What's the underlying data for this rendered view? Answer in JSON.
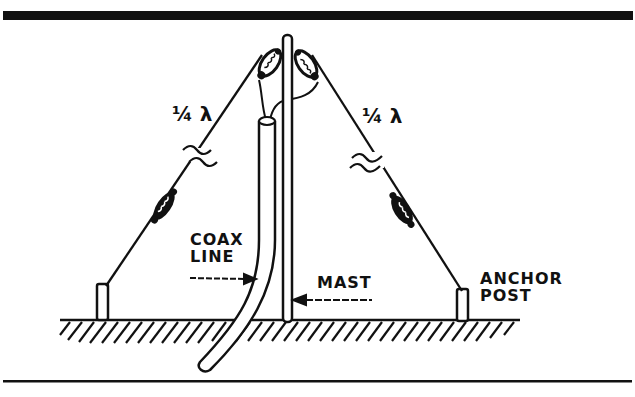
{
  "diagram": {
    "type": "antenna-installation",
    "labels": {
      "left_wire_length": "¼ λ",
      "right_wire_length": "¼ λ",
      "coax": [
        "COAX",
        "LINE"
      ],
      "mast": "MAST",
      "anchor": [
        "ANCHOR",
        "POST"
      ]
    },
    "components": [
      {
        "id": "mast",
        "name": "Mast"
      },
      {
        "id": "coax",
        "name": "Coax line"
      },
      {
        "id": "left-radial",
        "name": "Left quarter-wave wire"
      },
      {
        "id": "right-radial",
        "name": "Right quarter-wave wire"
      },
      {
        "id": "top-insulators",
        "count": 2
      },
      {
        "id": "mid-insulators",
        "count": 2
      },
      {
        "id": "anchor-posts",
        "count": 2
      },
      {
        "id": "ground"
      }
    ],
    "colors": {
      "ink": "#111111",
      "background": "#ffffff"
    }
  }
}
